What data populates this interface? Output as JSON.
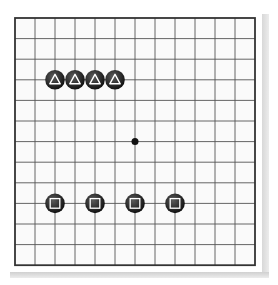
{
  "board": {
    "size_cols": 13,
    "size_rows": 13,
    "origin_x": 15,
    "origin_y": 18,
    "cell_w": 20,
    "cell_h": 20.6,
    "line_color": "#555555",
    "border_color": "#333333",
    "background": "#fafafa",
    "star_points": [
      {
        "col": 6,
        "row": 6
      }
    ]
  },
  "stones": [
    {
      "color": "black",
      "col": 2,
      "row": 3,
      "mark": "triangle"
    },
    {
      "color": "black",
      "col": 3,
      "row": 3,
      "mark": "triangle"
    },
    {
      "color": "black",
      "col": 4,
      "row": 3,
      "mark": "triangle"
    },
    {
      "color": "black",
      "col": 5,
      "row": 3,
      "mark": "triangle"
    },
    {
      "color": "black",
      "col": 2,
      "row": 9,
      "mark": "square"
    },
    {
      "color": "black",
      "col": 4,
      "row": 9,
      "mark": "square"
    },
    {
      "color": "black",
      "col": 6,
      "row": 9,
      "mark": "square"
    },
    {
      "color": "black",
      "col": 8,
      "row": 9,
      "mark": "square"
    }
  ],
  "colors": {
    "stone_black_center": "#5a5a5a",
    "stone_black_edge": "#111111",
    "mark_color": "#ffffff"
  }
}
